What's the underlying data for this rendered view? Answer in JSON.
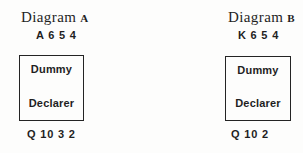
{
  "page": {
    "background_color": "#fdfdfc",
    "ink_color": "#1f1f1f",
    "border_color": "#242424"
  },
  "diagrams": [
    {
      "title_word": "Diagram",
      "title_letter": "A",
      "north_holding": "A 6 5 4",
      "dummy_label": "Dummy",
      "declarer_label": "Declarer",
      "south_holding": "Q 10 3 2"
    },
    {
      "title_word": "Diagram",
      "title_letter": "B",
      "north_holding": "K 6 5 4",
      "dummy_label": "Dummy",
      "declarer_label": "Declarer",
      "south_holding": "Q 10 2"
    }
  ]
}
